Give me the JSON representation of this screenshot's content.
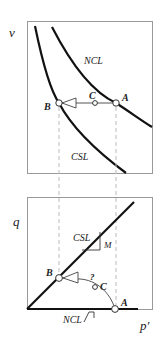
{
  "top_panel": {
    "y_axis_label": "v",
    "curves": [
      {
        "name": "NCL",
        "label": "NCL"
      },
      {
        "name": "CSL",
        "label": "CSL"
      }
    ],
    "points": [
      {
        "id": "A",
        "label": "A"
      },
      {
        "id": "B",
        "label": "B"
      },
      {
        "id": "C",
        "label": "C"
      }
    ]
  },
  "bottom_panel": {
    "y_axis_label": "q",
    "x_axis_label": "p′",
    "csl_label": "CSL",
    "slope_label": "M",
    "ncl_label": "NCL",
    "question_mark": "?",
    "points": [
      {
        "id": "A",
        "label": "A"
      },
      {
        "id": "B",
        "label": "B"
      },
      {
        "id": "C",
        "label": "C"
      }
    ]
  },
  "colors": {
    "curve": "#111111",
    "frame": "#888888",
    "dashed": "#bbbbbb",
    "path": "#555555"
  }
}
